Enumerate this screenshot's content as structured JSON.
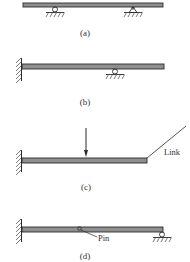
{
  "figure": {
    "panels": [
      {
        "id": "a",
        "label": "(a)",
        "description": "Simply supported beam: roller support and pin support"
      },
      {
        "id": "b",
        "label": "(b)",
        "description": "Propped cantilever: fixed wall and roller support"
      },
      {
        "id": "c",
        "label": "(c)",
        "description": "Cantilever with point load and end link",
        "annotation": "Link"
      },
      {
        "id": "d",
        "label": "(d)",
        "description": "Beam fixed at wall with internal pin and end roller",
        "annotation": "Pin"
      }
    ],
    "colors": {
      "beam": "#8f8f8f",
      "ink": "#2a2a2a",
      "text": "#333333"
    }
  }
}
